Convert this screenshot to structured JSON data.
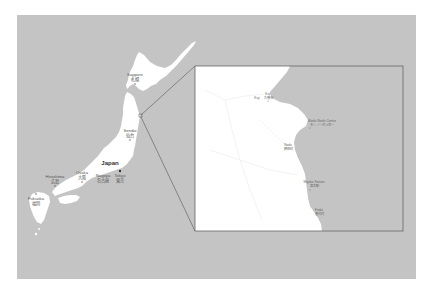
{
  "colors": {
    "sea": "#c4c4c4",
    "land": "#ffffff",
    "border": "#666666",
    "page": "#ffffff"
  },
  "main_map": {
    "country_label": "Japan",
    "cities": [
      {
        "en": "Sapporo",
        "jp": "札幌"
      },
      {
        "en": "Sendai",
        "jp": "仙台"
      },
      {
        "en": "Tokyo",
        "jp": "東京"
      },
      {
        "en": "Nagoya",
        "jp": "名古屋"
      },
      {
        "en": "Osaka",
        "jp": "大阪"
      },
      {
        "en": "Hiroshima",
        "jp": "広島"
      },
      {
        "en": "Fukuoka",
        "jp": "福岡"
      }
    ]
  },
  "inset_map": {
    "labels": [
      {
        "en": "Kuji",
        "jp": "久慈市"
      },
      {
        "en": "Kuji",
        "jp": "久慈市"
      },
      {
        "en": "Noda",
        "jp": "野田村"
      },
      {
        "en": "Moshi Noshi Center",
        "jp": "モシノシセンター"
      },
      {
        "en": "Miyako Station",
        "jp": "宮古駅"
      },
      {
        "en": "Fudai",
        "jp": "普代村"
      },
      {
        "en": "Iwaizumi",
        "jp": "岩泉町"
      }
    ]
  }
}
